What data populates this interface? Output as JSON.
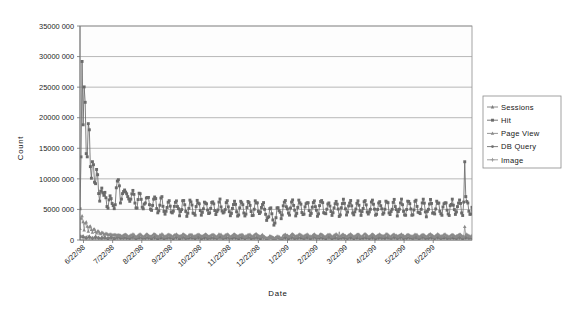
{
  "chart_data": {
    "type": "line",
    "title": "",
    "xlabel": "Date",
    "ylabel": "Count",
    "ylim": [
      0,
      35000000
    ],
    "grid": true,
    "legend_position": "right",
    "ytick_labels": [
      "0",
      "5000 000",
      "10000 000",
      "15000 000",
      "20000 000",
      "25000 000",
      "30000 000",
      "35000 000"
    ],
    "ytick_values": [
      0,
      5000000,
      10000000,
      15000000,
      20000000,
      25000000,
      30000000,
      35000000
    ],
    "xtick_labels": [
      "6/22/98",
      "7/22/98",
      "8/22/98",
      "9/22/98",
      "10/22/98",
      "11/22/98",
      "12/22/98",
      "1/22/99",
      "2/22/99",
      "3/22/99",
      "4/22/99",
      "5/22/99",
      "6/22/99"
    ],
    "x_axis_type": "date",
    "x_start": "6/22/98",
    "x_end": "7/06/99",
    "sample_interval_days": 1,
    "n_points": 379,
    "series": [
      {
        "name": "Sessions",
        "color": "#7d7d7d",
        "marker": "triangle",
        "baseline": 450000,
        "peak": 900000,
        "note": "Low flat series near zero baseline"
      },
      {
        "name": "Hit",
        "color": "#6a6a6a",
        "marker": "square",
        "baseline": 5200000,
        "peak": 29200000,
        "note": "Dominant series; initial spike to ~29.2M on 6/24/98, decays to ~5M baseline with strong weekly oscillation; terminal spike ~12.8M near 6/29/99"
      },
      {
        "name": "Page View",
        "color": "#8a8a8a",
        "marker": "triangle",
        "baseline": 700000,
        "peak": 4600000,
        "note": "Elevated early (to ~4.6M) then settles under 1M"
      },
      {
        "name": "DB Query",
        "color": "#707070",
        "marker": "circle",
        "baseline": 300000,
        "peak": 1400000,
        "note": "Low series hugging the axis"
      },
      {
        "name": "Image",
        "color": "#949494",
        "marker": "plus",
        "baseline": 250000,
        "peak": 1200000,
        "note": "Lowest series, essentially flat near zero"
      }
    ],
    "annotations": [
      {
        "label": "initial spike",
        "x": "6/24/98",
        "y": 29200000
      },
      {
        "label": "secondary peak",
        "x": "7/02/98",
        "y": 21400000
      },
      {
        "label": "tertiary peak",
        "x": "7/10/98",
        "y": 18700000
      },
      {
        "label": "terminal spike",
        "x": "6/29/99",
        "y": 12800000
      }
    ]
  },
  "legend": {
    "items": [
      {
        "label": "Sessions"
      },
      {
        "label": "Hit"
      },
      {
        "label": "Page View"
      },
      {
        "label": "DB Query"
      },
      {
        "label": "Image"
      }
    ]
  }
}
